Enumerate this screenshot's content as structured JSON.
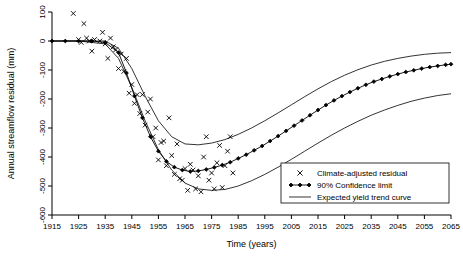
{
  "chart_data": {
    "type": "line",
    "title": "",
    "xlabel": "Time (years)",
    "ylabel": "Annual streamflow residual (mm)",
    "xlim": [
      1915,
      2065
    ],
    "ylim": [
      -600,
      100
    ],
    "xticks": [
      1915,
      1925,
      1935,
      1945,
      1955,
      1965,
      1975,
      1985,
      1995,
      2005,
      2015,
      2025,
      2035,
      2045,
      2055,
      2065
    ],
    "yticks": [
      100,
      0,
      -100,
      -200,
      -300,
      -400,
      -500,
      -600
    ],
    "grid": false,
    "legend_position": "bottom-right",
    "legend": [
      {
        "key": "scatter",
        "label": "Climate-adjusted residual",
        "marker": "x"
      },
      {
        "key": "trend",
        "label": "90% Confidence limit",
        "marker": "line-diamond"
      },
      {
        "key": "expected",
        "label": "Expected yield trend curve",
        "marker": "line"
      }
    ],
    "series": [
      {
        "name": "Climate-adjusted residual",
        "type": "scatter",
        "marker": "x",
        "points": [
          [
            1923,
            95
          ],
          [
            1925,
            5
          ],
          [
            1926,
            -5
          ],
          [
            1927,
            60
          ],
          [
            1928,
            10
          ],
          [
            1929,
            0
          ],
          [
            1930,
            -35
          ],
          [
            1931,
            5
          ],
          [
            1933,
            0
          ],
          [
            1934,
            30
          ],
          [
            1935,
            -10
          ],
          [
            1936,
            -60
          ],
          [
            1937,
            10
          ],
          [
            1938,
            -20
          ],
          [
            1939,
            -30
          ],
          [
            1940,
            -95
          ],
          [
            1941,
            -45
          ],
          [
            1942,
            -105
          ],
          [
            1943,
            -60
          ],
          [
            1944,
            -180
          ],
          [
            1945,
            -150
          ],
          [
            1946,
            -215
          ],
          [
            1947,
            -185
          ],
          [
            1948,
            -250
          ],
          [
            1949,
            -185
          ],
          [
            1950,
            -290
          ],
          [
            1951,
            -245
          ],
          [
            1952,
            -200
          ],
          [
            1953,
            -330
          ],
          [
            1954,
            -300
          ],
          [
            1955,
            -410
          ],
          [
            1956,
            -350
          ],
          [
            1957,
            -345
          ],
          [
            1958,
            -430
          ],
          [
            1959,
            -265
          ],
          [
            1960,
            -395
          ],
          [
            1961,
            -460
          ],
          [
            1962,
            -355
          ],
          [
            1963,
            -475
          ],
          [
            1964,
            -480
          ],
          [
            1965,
            -440
          ],
          [
            1966,
            -515
          ],
          [
            1967,
            -425
          ],
          [
            1968,
            -445
          ],
          [
            1969,
            -510
          ],
          [
            1970,
            -465
          ],
          [
            1971,
            -520
          ],
          [
            1972,
            -400
          ],
          [
            1973,
            -330
          ],
          [
            1974,
            -480
          ],
          [
            1975,
            -455
          ],
          [
            1976,
            -510
          ],
          [
            1977,
            -420
          ],
          [
            1978,
            -360
          ],
          [
            1979,
            -505
          ],
          [
            1980,
            -430
          ],
          [
            1981,
            -380
          ],
          [
            1982,
            -330
          ],
          [
            1983,
            -455
          ]
        ]
      },
      {
        "name": "Expected yield trend curve",
        "type": "line",
        "comment": "central trend with diamond markers; upper and lower 90% confidence limits drawn as plain curves",
        "x": [
          1915,
          1920,
          1925,
          1930,
          1935,
          1940,
          1943,
          1946,
          1949,
          1952,
          1955,
          1958,
          1961,
          1964,
          1967,
          1970,
          1973,
          1976,
          1979,
          1982,
          1985,
          1988,
          1991,
          1994,
          1997,
          2000,
          2003,
          2006,
          2009,
          2012,
          2015,
          2018,
          2021,
          2024,
          2027,
          2030,
          2033,
          2036,
          2039,
          2042,
          2045,
          2048,
          2051,
          2054,
          2057,
          2060,
          2063,
          2065
        ],
        "values": [
          0,
          0,
          0,
          0,
          -5,
          -40,
          -110,
          -190,
          -265,
          -330,
          -380,
          -415,
          -435,
          -445,
          -450,
          -448,
          -443,
          -436,
          -428,
          -418,
          -405,
          -392,
          -377,
          -362,
          -345,
          -328,
          -310,
          -292,
          -274,
          -256,
          -238,
          -221,
          -205,
          -190,
          -176,
          -163,
          -151,
          -140,
          -131,
          -122,
          -114,
          -107,
          -101,
          -95,
          -90,
          -86,
          -82,
          -80
        ]
      },
      {
        "name": "90% Confidence limit (upper)",
        "type": "line",
        "x": [
          1915,
          1925,
          1935,
          1940,
          1945,
          1950,
          1955,
          1960,
          1965,
          1970,
          1975,
          1980,
          1985,
          1990,
          1995,
          2000,
          2005,
          2010,
          2015,
          2020,
          2025,
          2030,
          2035,
          2040,
          2045,
          2050,
          2055,
          2060,
          2065
        ],
        "values": [
          0,
          0,
          0,
          -25,
          -95,
          -190,
          -275,
          -330,
          -355,
          -358,
          -352,
          -340,
          -322,
          -300,
          -275,
          -248,
          -220,
          -192,
          -165,
          -140,
          -118,
          -99,
          -83,
          -70,
          -60,
          -52,
          -46,
          -42,
          -40
        ]
      },
      {
        "name": "90% Confidence limit (lower)",
        "type": "line",
        "x": [
          1915,
          1925,
          1935,
          1940,
          1945,
          1950,
          1955,
          1960,
          1965,
          1970,
          1975,
          1980,
          1985,
          1990,
          1995,
          2000,
          2005,
          2010,
          2015,
          2020,
          2025,
          2030,
          2035,
          2040,
          2045,
          2050,
          2055,
          2060,
          2065
        ],
        "values": [
          0,
          0,
          -10,
          -60,
          -160,
          -275,
          -375,
          -445,
          -490,
          -510,
          -515,
          -512,
          -500,
          -482,
          -460,
          -435,
          -408,
          -380,
          -352,
          -325,
          -300,
          -277,
          -256,
          -238,
          -222,
          -208,
          -197,
          -188,
          -182
        ]
      }
    ]
  }
}
